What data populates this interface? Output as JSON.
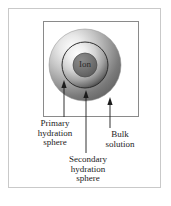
{
  "figure": {
    "ion_label": "Ion",
    "colors": {
      "outer_frame": "#c9c9c9",
      "inner_box_border": "#8a8a8a",
      "leader_line": "#1c1c1c",
      "text": "#1c1c1c",
      "ion_fill": "#6e6e6e",
      "primary_sphere_light": "#f2f2f2",
      "primary_sphere_dark": "#3a3a3a",
      "secondary_sphere_light": "#ededed",
      "secondary_sphere_dark": "#4a4a4a",
      "bulk_light": "#fafafa",
      "bulk_dark": "#6b6b6b",
      "background": "#ffffff"
    }
  },
  "spheres": [
    {
      "name": "bulk-solution",
      "cx": 85,
      "cy": 65,
      "r": 36
    },
    {
      "name": "secondary-hydration-sphere",
      "cx": 85,
      "cy": 65,
      "r": 23
    },
    {
      "name": "primary-hydration-sphere",
      "cx": 85,
      "cy": 65,
      "r": 12
    }
  ],
  "callouts": [
    {
      "id": "primary",
      "label": "Primary\nhydration\nsphere",
      "line1": "Primary",
      "line2": "hydration",
      "line3": "sphere",
      "arrow_tip_x": 64,
      "arrow_tip_y": 86,
      "elbow_x": 64,
      "elbow_y": 117,
      "text_x": 55,
      "text_y": 119
    },
    {
      "id": "secondary",
      "label": "Secondary\nhydration\nsphere",
      "line1": "Secondary",
      "line2": "hydration",
      "line3": "sphere",
      "arrow_tip_x": 86,
      "arrow_tip_y": 95,
      "elbow_x": 86,
      "elbow_y": 153,
      "text_x": 88,
      "text_y": 155
    },
    {
      "id": "bulk",
      "label": "Bulk\nsolution",
      "line1": "Bulk",
      "line2": "solution",
      "arrow_tip_x": 110,
      "arrow_tip_y": 102,
      "elbow_x": 110,
      "elbow_y": 128,
      "text_x": 120,
      "text_y": 130
    }
  ]
}
